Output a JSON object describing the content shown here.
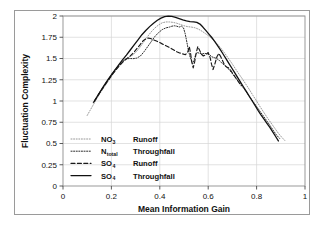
{
  "figure": {
    "background": "#ffffff",
    "frame_color": "#9a9a9a"
  },
  "chart_data": {
    "type": "line",
    "title": "",
    "xlabel": "Mean Information Gain",
    "ylabel": "Fluctuation Complexity",
    "xlim": [
      0,
      1
    ],
    "ylim": [
      0,
      2
    ],
    "xticks": [
      "0",
      "0.2",
      "0.4",
      "0.6",
      "0.8",
      "1"
    ],
    "xtick_values": [
      0,
      0.2,
      0.4,
      0.6,
      0.8,
      1
    ],
    "yticks": [
      "0",
      "0.25",
      "0.5",
      "0.75",
      "1",
      "1.25",
      "1.5",
      "1.75",
      "2"
    ],
    "ytick_values": [
      0,
      0.25,
      0.5,
      0.75,
      1,
      1.25,
      1.5,
      1.75,
      2
    ],
    "grid": true,
    "legend_position": "lower left",
    "series": [
      {
        "name": "NO3 Runoff",
        "label_main": "NO",
        "label_sub": "3",
        "label_suffix": "Runoff",
        "style": "fine-dotted",
        "color": "#8d8d8d",
        "dash": "1,1.6",
        "width": 0.9,
        "points": [
          [
            0.1,
            0.83
          ],
          [
            0.12,
            0.93
          ],
          [
            0.14,
            1.03
          ],
          [
            0.16,
            1.12
          ],
          [
            0.18,
            1.205
          ],
          [
            0.2,
            1.29
          ],
          [
            0.22,
            1.37
          ],
          [
            0.24,
            1.44
          ],
          [
            0.26,
            1.495
          ],
          [
            0.275,
            1.52
          ],
          [
            0.29,
            1.545
          ],
          [
            0.305,
            1.585
          ],
          [
            0.32,
            1.64
          ],
          [
            0.335,
            1.7
          ],
          [
            0.35,
            1.76
          ],
          [
            0.365,
            1.815
          ],
          [
            0.38,
            1.86
          ],
          [
            0.395,
            1.895
          ],
          [
            0.41,
            1.92
          ],
          [
            0.425,
            1.93
          ],
          [
            0.44,
            1.93
          ],
          [
            0.455,
            1.925
          ],
          [
            0.47,
            1.915
          ],
          [
            0.485,
            1.9
          ],
          [
            0.5,
            1.885
          ],
          [
            0.515,
            1.875
          ],
          [
            0.53,
            1.87
          ],
          [
            0.545,
            1.862
          ],
          [
            0.56,
            1.845
          ],
          [
            0.575,
            1.82
          ],
          [
            0.59,
            1.79
          ],
          [
            0.605,
            1.76
          ],
          [
            0.62,
            1.72
          ],
          [
            0.635,
            1.68
          ],
          [
            0.65,
            1.63
          ],
          [
            0.665,
            1.575
          ],
          [
            0.68,
            1.515
          ],
          [
            0.695,
            1.455
          ],
          [
            0.71,
            1.39
          ],
          [
            0.725,
            1.325
          ],
          [
            0.74,
            1.265
          ],
          [
            0.755,
            1.2
          ],
          [
            0.77,
            1.135
          ],
          [
            0.785,
            1.065
          ],
          [
            0.8,
            1.0
          ],
          [
            0.815,
            0.93
          ],
          [
            0.83,
            0.865
          ],
          [
            0.845,
            0.8
          ],
          [
            0.86,
            0.74
          ],
          [
            0.875,
            0.68
          ],
          [
            0.89,
            0.62
          ],
          [
            0.905,
            0.57
          ],
          [
            0.92,
            0.525
          ]
        ]
      },
      {
        "name": "Ntotal Throughfall",
        "label_main": "N",
        "label_sub": "total",
        "label_suffix": "Throughfall",
        "style": "dotted",
        "color": "#2b2b2b",
        "dash": "1.1,1.5",
        "width": 1.0,
        "points": [
          [
            0.125,
            0.98
          ],
          [
            0.145,
            1.07
          ],
          [
            0.165,
            1.16
          ],
          [
            0.185,
            1.245
          ],
          [
            0.205,
            1.33
          ],
          [
            0.225,
            1.405
          ],
          [
            0.245,
            1.465
          ],
          [
            0.26,
            1.495
          ],
          [
            0.275,
            1.5
          ],
          [
            0.29,
            1.498
          ],
          [
            0.305,
            1.505
          ],
          [
            0.32,
            1.53
          ],
          [
            0.335,
            1.58
          ],
          [
            0.35,
            1.64
          ],
          [
            0.365,
            1.7
          ],
          [
            0.38,
            1.76
          ],
          [
            0.395,
            1.805
          ],
          [
            0.41,
            1.84
          ],
          [
            0.425,
            1.86
          ],
          [
            0.44,
            1.87
          ],
          [
            0.45,
            1.88
          ],
          [
            0.46,
            1.885
          ],
          [
            0.47,
            1.88
          ],
          [
            0.48,
            1.87
          ],
          [
            0.49,
            1.88
          ],
          [
            0.498,
            1.86
          ],
          [
            0.505,
            1.79
          ],
          [
            0.512,
            1.69
          ],
          [
            0.518,
            1.6
          ],
          [
            0.524,
            1.53
          ],
          [
            0.53,
            1.48
          ],
          [
            0.536,
            1.44
          ],
          [
            0.542,
            1.48
          ],
          [
            0.548,
            1.545
          ],
          [
            0.556,
            1.57
          ],
          [
            0.565,
            1.56
          ],
          [
            0.575,
            1.555
          ],
          [
            0.585,
            1.56
          ],
          [
            0.595,
            1.555
          ],
          [
            0.605,
            1.545
          ],
          [
            0.615,
            1.52
          ],
          [
            0.625,
            1.51
          ],
          [
            0.635,
            1.5
          ],
          [
            0.645,
            1.48
          ],
          [
            0.655,
            1.45
          ],
          [
            0.668,
            1.42
          ],
          [
            0.68,
            1.39
          ],
          [
            0.695,
            1.34
          ],
          [
            0.71,
            1.285
          ],
          [
            0.725,
            1.23
          ],
          [
            0.74,
            1.175
          ],
          [
            0.755,
            1.115
          ],
          [
            0.77,
            1.055
          ],
          [
            0.785,
            0.995
          ],
          [
            0.8,
            0.935
          ],
          [
            0.815,
            0.875
          ],
          [
            0.83,
            0.815
          ],
          [
            0.845,
            0.755
          ],
          [
            0.858,
            0.7
          ],
          [
            0.87,
            0.65
          ],
          [
            0.882,
            0.6
          ],
          [
            0.895,
            0.56
          ]
        ]
      },
      {
        "name": "SO4 Runoff",
        "label_main": "SO",
        "label_sub": "4",
        "label_suffix": "Runoff",
        "style": "dashed",
        "color": "#1a1a1a",
        "dash": "4,2.4",
        "width": 1.15,
        "points": [
          [
            0.13,
            1.0
          ],
          [
            0.15,
            1.09
          ],
          [
            0.17,
            1.175
          ],
          [
            0.19,
            1.255
          ],
          [
            0.21,
            1.335
          ],
          [
            0.23,
            1.405
          ],
          [
            0.248,
            1.46
          ],
          [
            0.262,
            1.495
          ],
          [
            0.278,
            1.53
          ],
          [
            0.292,
            1.57
          ],
          [
            0.305,
            1.615
          ],
          [
            0.318,
            1.66
          ],
          [
            0.33,
            1.705
          ],
          [
            0.342,
            1.73
          ],
          [
            0.352,
            1.74
          ],
          [
            0.362,
            1.735
          ],
          [
            0.374,
            1.72
          ],
          [
            0.386,
            1.705
          ],
          [
            0.398,
            1.69
          ],
          [
            0.41,
            1.672
          ],
          [
            0.422,
            1.655
          ],
          [
            0.434,
            1.638
          ],
          [
            0.446,
            1.62
          ],
          [
            0.458,
            1.6
          ],
          [
            0.47,
            1.58
          ],
          [
            0.482,
            1.565
          ],
          [
            0.494,
            1.555
          ],
          [
            0.506,
            1.545
          ],
          [
            0.516,
            1.58
          ],
          [
            0.522,
            1.64
          ],
          [
            0.527,
            1.565
          ],
          [
            0.532,
            1.46
          ],
          [
            0.538,
            1.39
          ],
          [
            0.544,
            1.46
          ],
          [
            0.55,
            1.56
          ],
          [
            0.557,
            1.64
          ],
          [
            0.564,
            1.6
          ],
          [
            0.572,
            1.55
          ],
          [
            0.58,
            1.53
          ],
          [
            0.59,
            1.545
          ],
          [
            0.6,
            1.57
          ],
          [
            0.608,
            1.51
          ],
          [
            0.614,
            1.43
          ],
          [
            0.62,
            1.37
          ],
          [
            0.628,
            1.44
          ],
          [
            0.636,
            1.52
          ],
          [
            0.644,
            1.56
          ],
          [
            0.652,
            1.52
          ],
          [
            0.66,
            1.47
          ],
          [
            0.668,
            1.42
          ],
          [
            0.676,
            1.4
          ],
          [
            0.684,
            1.39
          ],
          [
            0.692,
            1.365
          ],
          [
            0.7,
            1.33
          ],
          [
            0.712,
            1.28
          ],
          [
            0.724,
            1.23
          ],
          [
            0.736,
            1.18
          ]
        ]
      },
      {
        "name": "SO4 Throughfall",
        "label_main": "SO",
        "label_sub": "4",
        "label_suffix": "Throughfall",
        "style": "solid",
        "color": "#111111",
        "dash": "0",
        "width": 1.3,
        "points": [
          [
            0.128,
            0.99
          ],
          [
            0.148,
            1.085
          ],
          [
            0.168,
            1.175
          ],
          [
            0.188,
            1.26
          ],
          [
            0.208,
            1.34
          ],
          [
            0.228,
            1.415
          ],
          [
            0.245,
            1.48
          ],
          [
            0.262,
            1.54
          ],
          [
            0.278,
            1.6
          ],
          [
            0.294,
            1.66
          ],
          [
            0.31,
            1.72
          ],
          [
            0.326,
            1.78
          ],
          [
            0.342,
            1.83
          ],
          [
            0.358,
            1.875
          ],
          [
            0.374,
            1.915
          ],
          [
            0.39,
            1.95
          ],
          [
            0.405,
            1.975
          ],
          [
            0.42,
            1.992
          ],
          [
            0.435,
            1.998
          ],
          [
            0.45,
            1.995
          ],
          [
            0.465,
            1.985
          ],
          [
            0.48,
            1.97
          ],
          [
            0.495,
            1.955
          ],
          [
            0.51,
            1.942
          ],
          [
            0.525,
            1.935
          ],
          [
            0.54,
            1.932
          ],
          [
            0.553,
            1.925
          ],
          [
            0.566,
            1.905
          ],
          [
            0.578,
            1.87
          ],
          [
            0.59,
            1.83
          ],
          [
            0.602,
            1.79
          ],
          [
            0.614,
            1.75
          ],
          [
            0.626,
            1.705
          ],
          [
            0.638,
            1.655
          ],
          [
            0.65,
            1.605
          ],
          [
            0.662,
            1.55
          ],
          [
            0.674,
            1.495
          ],
          [
            0.686,
            1.44
          ],
          [
            0.698,
            1.385
          ],
          [
            0.71,
            1.33
          ],
          [
            0.722,
            1.275
          ],
          [
            0.734,
            1.22
          ],
          [
            0.746,
            1.165
          ],
          [
            0.758,
            1.11
          ],
          [
            0.77,
            1.055
          ],
          [
            0.782,
            1.0
          ],
          [
            0.794,
            0.945
          ],
          [
            0.806,
            0.89
          ],
          [
            0.818,
            0.838
          ],
          [
            0.83,
            0.79
          ],
          [
            0.842,
            0.74
          ],
          [
            0.854,
            0.692
          ],
          [
            0.866,
            0.64
          ],
          [
            0.878,
            0.585
          ],
          [
            0.89,
            0.53
          ]
        ]
      }
    ]
  }
}
